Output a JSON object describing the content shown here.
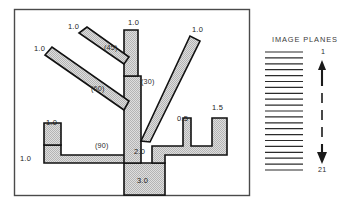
{
  "figure": {
    "frame": {
      "x": 14,
      "y": 9,
      "width": 236,
      "height": 187
    },
    "tree_label": "branching-tree-diagram",
    "diameter_labels": [
      {
        "id": "trunk",
        "text": "3.0",
        "x": 137,
        "y": 177
      },
      {
        "id": "main-stem",
        "text": "2.0",
        "x": 134,
        "y": 148
      },
      {
        "id": "branch-top",
        "text": "1.0",
        "x": 128,
        "y": 19
      },
      {
        "id": "branch-ul",
        "text": "1.0",
        "x": 68,
        "y": 23
      },
      {
        "id": "branch-left",
        "text": "1.0",
        "x": 34,
        "y": 45
      },
      {
        "id": "branch-ur",
        "text": "1.0",
        "x": 192,
        "y": 26
      },
      {
        "id": "branch-lleft",
        "text": "1.0",
        "x": 46,
        "y": 119
      },
      {
        "id": "branch-lower",
        "text": "1.0",
        "x": 20,
        "y": 155
      },
      {
        "id": "branch-small",
        "text": "0.5",
        "x": 177,
        "y": 115
      },
      {
        "id": "branch-right",
        "text": "1.5",
        "x": 212,
        "y": 104
      }
    ],
    "angle_labels": [
      {
        "id": "angle-45",
        "text": "(45)",
        "x": 104,
        "y": 44
      },
      {
        "id": "angle-60",
        "text": "(60)",
        "x": 91,
        "y": 85
      },
      {
        "id": "angle-30",
        "text": "(30)",
        "x": 141,
        "y": 78
      },
      {
        "id": "angle-90",
        "text": "(90)",
        "x": 95,
        "y": 142
      }
    ]
  },
  "image_planes": {
    "title": "IMAGE PLANES",
    "title_x": 272,
    "title_y": 39,
    "plane_count": 21,
    "stack": {
      "x": 265,
      "y": 52,
      "width": 38,
      "height": 118
    },
    "axis": {
      "top_label": "1",
      "bottom_label": "21",
      "x": 322,
      "top_y": 51,
      "bottom_y": 172
    }
  },
  "colors": {
    "fill": "#d2d2d2",
    "stroke": "#111111",
    "frame": "#4a4a4a",
    "text": "#1c1c1c",
    "line": "#2b2b2b"
  }
}
